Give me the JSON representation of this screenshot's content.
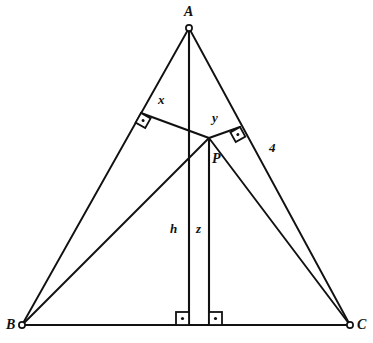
{
  "figure": {
    "kind": "geometry-diagram",
    "background_color": "#ffffff",
    "stroke_color": "#111111",
    "marker_fill": "#ffffff"
  },
  "vertices": [
    {
      "id": "A",
      "label": "A",
      "x": 189,
      "y": 28,
      "label_x": 184,
      "label_y": 5
    },
    {
      "id": "B",
      "label": "B",
      "x": 22,
      "y": 325,
      "label_x": 6,
      "label_y": 318
    },
    {
      "id": "C",
      "label": "C",
      "x": 350,
      "y": 325,
      "label_x": 357,
      "label_y": 318
    }
  ],
  "interior_point": {
    "id": "P",
    "label": "P",
    "x": 209,
    "y": 138,
    "label_x": 212,
    "label_y": 152
  },
  "feet": {
    "on_AB": {
      "x": 141,
      "y": 113
    },
    "on_AC": {
      "x": 240,
      "y": 127
    },
    "altitude_foot": {
      "x": 189,
      "y": 325
    },
    "z_foot": {
      "x": 209,
      "y": 325
    }
  },
  "sides": [
    {
      "id": "AB",
      "from": "A",
      "to": "B"
    },
    {
      "id": "AC",
      "from": "A",
      "to": "C"
    },
    {
      "id": "BC",
      "from": "B",
      "to": "C"
    }
  ],
  "segments": [
    {
      "id": "PB",
      "name": "p-to-b-cevian"
    },
    {
      "id": "PC",
      "name": "p-to-c-cevian"
    },
    {
      "id": "Px",
      "name": "perpendicular-to-ab"
    },
    {
      "id": "Py",
      "name": "perpendicular-to-ac"
    },
    {
      "id": "Ah",
      "name": "altitude-from-a"
    },
    {
      "id": "Pz",
      "name": "perpendicular-to-bc"
    }
  ],
  "labels": {
    "x": {
      "text": "x",
      "label_x": 158,
      "label_y": 93
    },
    "y": {
      "text": "y",
      "label_x": 212,
      "label_y": 111
    },
    "four": {
      "text": "4",
      "label_x": 269,
      "label_y": 141
    },
    "h": {
      "text": "h",
      "label_x": 170,
      "label_y": 222
    },
    "z": {
      "text": "z",
      "label_x": 196,
      "label_y": 222
    }
  },
  "right_angle_markers": [
    {
      "id": "ra-ab",
      "name": "right-angle-on-ab"
    },
    {
      "id": "ra-ac",
      "name": "right-angle-on-ac"
    },
    {
      "id": "ra-h",
      "name": "right-angle-altitude-base"
    },
    {
      "id": "ra-z",
      "name": "right-angle-z-base"
    }
  ]
}
